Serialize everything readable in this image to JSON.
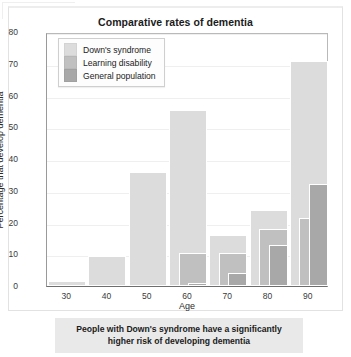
{
  "chart_data": {
    "type": "bar",
    "title": "Comparative rates of dementia",
    "xlabel": "Age",
    "ylabel": "Percentage that develop dementia",
    "categories": [
      "30",
      "40",
      "50",
      "60",
      "70",
      "80",
      "90"
    ],
    "xlim": [
      25,
      95
    ],
    "ylim": [
      0,
      80
    ],
    "yticks": [
      0,
      10,
      20,
      30,
      40,
      50,
      60,
      70,
      80
    ],
    "grid": true,
    "legend_position": "top-left",
    "series": [
      {
        "name": "Down's syndrome",
        "color": "#dcdcdc",
        "values": [
          1.5,
          9.5,
          36,
          55.5,
          16,
          24,
          71
        ]
      },
      {
        "name": "Learning disability",
        "color": "#c0c0c0",
        "values": [
          0,
          0,
          0,
          10.5,
          10.5,
          18,
          21.5
        ]
      },
      {
        "name": "General population",
        "color": "#a8a8a8",
        "values": [
          0,
          0,
          0,
          0.8,
          4,
          13,
          32
        ]
      }
    ]
  },
  "caption": {
    "text": "People with Down's syndrome have a significantly higher risk of developing dementia"
  }
}
